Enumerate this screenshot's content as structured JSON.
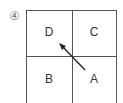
{
  "figure": {
    "number_label": "④",
    "cells": [
      {
        "id": "D",
        "label": "D",
        "position": "top-left"
      },
      {
        "id": "C",
        "label": "C",
        "position": "top-right"
      },
      {
        "id": "B",
        "label": "B",
        "position": "bottom-left"
      },
      {
        "id": "A",
        "label": "A",
        "position": "bottom-right"
      }
    ],
    "arrow": {
      "from": "A",
      "to": "D",
      "color": "#222222"
    }
  }
}
